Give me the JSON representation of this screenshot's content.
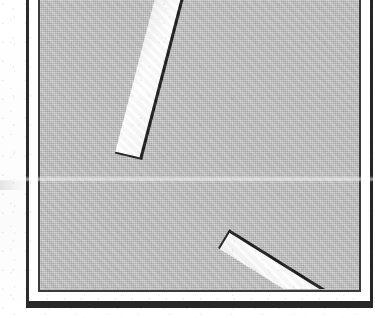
{
  "figure": {
    "kind": "scanned-line-drawing",
    "caption": "",
    "background_color": "#b6b6b6",
    "paper_color": "#ffffff",
    "ink_color": "#1c1c1c"
  },
  "frame": {
    "outer_rule_color": "#272727",
    "inner_rule_color": "#3a3a3a",
    "margin_color": "#ffffff",
    "has_drop_shadow": true
  },
  "shapes": {
    "bars": [
      {
        "name": "upper-bar",
        "fill": "#fbfbfb",
        "outline": "#1c1c1c",
        "rotation_deg": 13,
        "length_px": 166,
        "width_px": 28,
        "top_left_x": 116,
        "top_left_y": 6
      },
      {
        "name": "lower-bar",
        "fill": "#fbfbfb",
        "outline": "#1b1b1b",
        "rotation_deg": -59,
        "length_px": 152,
        "width_px": 22,
        "top_left_x": 178,
        "top_left_y": 258
      }
    ]
  },
  "artifacts": {
    "scan_seam_y": 178,
    "scan_seam_label": "horizontal scan seam"
  }
}
